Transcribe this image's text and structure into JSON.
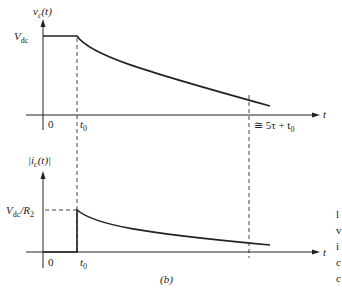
{
  "figure": {
    "caption": "(b)",
    "top_plot": {
      "y_label": "v",
      "y_label_sub": "c",
      "y_label_arg": "(t)",
      "level_label": "V",
      "level_label_sub": "dc",
      "x_axis_label": "t",
      "origin_label": "0",
      "t0_label": "t",
      "t0_sub": "0",
      "settle_label": "≅ 5τ + t",
      "settle_sub": "0"
    },
    "bottom_plot": {
      "y_label": "|i",
      "y_label_sub": "c",
      "y_label_arg": "(t)|",
      "level_label": "V",
      "level_label_sub": "dc",
      "level_label_rest": "/R",
      "level_label_sub2": "2",
      "x_axis_label": "t",
      "origin_label": "0",
      "t0_label": "t",
      "t0_sub": "0"
    },
    "side_text_fragments": [
      "l",
      "v",
      "i",
      "c",
      "c"
    ]
  }
}
